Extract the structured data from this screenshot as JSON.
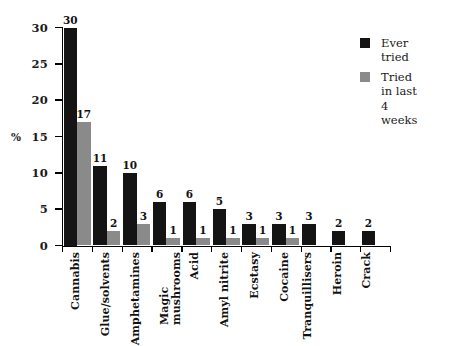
{
  "chart_data": {
    "type": "bar",
    "title": "",
    "xlabel": "",
    "ylabel": "%",
    "ylim": [
      0,
      30
    ],
    "yticks": [
      0,
      5,
      10,
      15,
      20,
      25,
      30
    ],
    "grid": false,
    "legend_position": "top-right",
    "categories": [
      "Cannabis",
      "Glue/solvents",
      "Amphetamines",
      "Magic\nmushrooms",
      "Acid",
      "Amyl nitrite",
      "Ecstasy",
      "Cocaine",
      "Tranquillisers",
      "Heroin",
      "Crack"
    ],
    "series": [
      {
        "name": "Ever tried",
        "color": "#141414",
        "values": [
          30,
          11,
          10,
          6,
          6,
          5,
          3,
          3,
          3,
          2,
          2
        ]
      },
      {
        "name": "Tried in last 4 weeks",
        "color": "#8a8a8a",
        "values": [
          17,
          2,
          3,
          1,
          1,
          1,
          1,
          1,
          null,
          null,
          null
        ]
      }
    ]
  },
  "legend": {
    "items": [
      {
        "label": "Ever tried",
        "swatch": "black-square-swatch"
      },
      {
        "label": "Tried in last\n4 weeks",
        "swatch": "gray-square-swatch"
      }
    ]
  },
  "axes": {
    "y_title": "%",
    "y_tick_labels": [
      "30",
      "25",
      "20",
      "15",
      "10",
      "5",
      "0"
    ]
  },
  "value_labels": {
    "ever": [
      "30",
      "11",
      "10",
      "6",
      "6",
      "5",
      "3",
      "3",
      "3",
      "2",
      "2"
    ],
    "recent": [
      "17",
      "2",
      "3",
      "1",
      "1",
      "1",
      "1",
      "1",
      "",
      "",
      ""
    ]
  }
}
